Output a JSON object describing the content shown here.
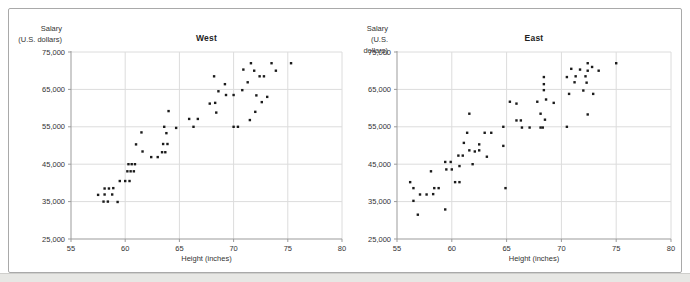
{
  "figure": {
    "background": "#ffffff",
    "frame_border_color": "#a9a9a9",
    "outside_strip_color": "#e7e7e4"
  },
  "colors": {
    "dot": "#1b1b1b",
    "grid": "#dcdcdc",
    "axis": "#9b9b9b",
    "tick_text": "#333333"
  },
  "chart_data": [
    {
      "type": "scatter",
      "title": "West",
      "xlabel": "Height (inches)",
      "ylabel_lines": [
        "Salary",
        "(U.S. dollars)"
      ],
      "xlim": [
        55,
        80
      ],
      "ylim": [
        25000,
        75000
      ],
      "grid": true,
      "legend": "none",
      "xticks": [
        55,
        60,
        65,
        70,
        75,
        80
      ],
      "xtick_labels": [
        "55",
        "60",
        "65",
        "70",
        "75",
        "80"
      ],
      "yticks": [
        25000,
        35000,
        45000,
        55000,
        65000,
        75000
      ],
      "ytick_labels": [
        "25,000",
        "35,000",
        "45,000",
        "55,000",
        "65,000",
        "75,000"
      ],
      "points": [
        [
          57.5,
          36800
        ],
        [
          58.1,
          36900
        ],
        [
          58.8,
          36900
        ],
        [
          58.1,
          38500
        ],
        [
          58.5,
          38500
        ],
        [
          58.9,
          38600
        ],
        [
          58.0,
          35000
        ],
        [
          58.4,
          35000
        ],
        [
          59.3,
          34900
        ],
        [
          59.5,
          40500
        ],
        [
          60.0,
          40500
        ],
        [
          60.4,
          40500
        ],
        [
          60.2,
          43100
        ],
        [
          60.5,
          43100
        ],
        [
          60.8,
          43100
        ],
        [
          60.3,
          45000
        ],
        [
          60.6,
          45000
        ],
        [
          60.9,
          45000
        ],
        [
          61.0,
          50300
        ],
        [
          61.6,
          48400
        ],
        [
          61.5,
          53500
        ],
        [
          62.4,
          46900
        ],
        [
          63.0,
          46900
        ],
        [
          63.4,
          48200
        ],
        [
          63.7,
          48200
        ],
        [
          63.5,
          50400
        ],
        [
          63.9,
          50400
        ],
        [
          63.8,
          53300
        ],
        [
          64.0,
          59200
        ],
        [
          64.7,
          54700
        ],
        [
          63.6,
          55000
        ],
        [
          66.3,
          55000
        ],
        [
          65.9,
          57100
        ],
        [
          66.7,
          57100
        ],
        [
          68.4,
          58800
        ],
        [
          67.8,
          61200
        ],
        [
          68.3,
          61400
        ],
        [
          68.6,
          64500
        ],
        [
          68.2,
          68500
        ],
        [
          69.2,
          66400
        ],
        [
          69.3,
          63500
        ],
        [
          70.0,
          63500
        ],
        [
          70.8,
          64800
        ],
        [
          71.3,
          66900
        ],
        [
          70.9,
          70300
        ],
        [
          71.6,
          72000
        ],
        [
          71.9,
          70000
        ],
        [
          72.4,
          68500
        ],
        [
          72.8,
          68500
        ],
        [
          73.5,
          72000
        ],
        [
          73.9,
          70000
        ],
        [
          75.3,
          72000
        ],
        [
          70.0,
          55000
        ],
        [
          70.4,
          55000
        ],
        [
          71.5,
          56800
        ],
        [
          72.0,
          59000
        ],
        [
          72.6,
          61600
        ],
        [
          73.1,
          63000
        ],
        [
          72.1,
          63400
        ]
      ]
    },
    {
      "type": "scatter",
      "title": "East",
      "xlabel": "Height (inches)",
      "ylabel_lines": [
        "Salary",
        "(U.S. dollars)"
      ],
      "xlim": [
        55,
        80
      ],
      "ylim": [
        25000,
        75000
      ],
      "grid": true,
      "legend": "none",
      "xticks": [
        55,
        60,
        65,
        70,
        75,
        80
      ],
      "xtick_labels": [
        "55",
        "60",
        "65",
        "70",
        "75",
        "80"
      ],
      "yticks": [
        25000,
        35000,
        45000,
        55000,
        65000,
        75000
      ],
      "ytick_labels": [
        "25,000",
        "35,000",
        "45,000",
        "55,000",
        "65,000",
        "75,000"
      ],
      "points": [
        [
          56.2,
          40200
        ],
        [
          56.5,
          38600
        ],
        [
          56.5,
          35200
        ],
        [
          56.9,
          31500
        ],
        [
          57.1,
          36900
        ],
        [
          57.7,
          36900
        ],
        [
          58.3,
          37000
        ],
        [
          58.1,
          43100
        ],
        [
          58.4,
          38600
        ],
        [
          58.8,
          38600
        ],
        [
          59.4,
          32900
        ],
        [
          59.4,
          45600
        ],
        [
          59.9,
          45600
        ],
        [
          59.5,
          43600
        ],
        [
          60.0,
          43600
        ],
        [
          60.3,
          40200
        ],
        [
          60.7,
          40200
        ],
        [
          60.7,
          44500
        ],
        [
          60.6,
          47300
        ],
        [
          61.0,
          47300
        ],
        [
          61.6,
          48700
        ],
        [
          62.1,
          48400
        ],
        [
          62.5,
          48700
        ],
        [
          61.1,
          50700
        ],
        [
          62.5,
          50300
        ],
        [
          61.4,
          53400
        ],
        [
          63.0,
          53400
        ],
        [
          63.6,
          53400
        ],
        [
          61.6,
          58500
        ],
        [
          61.9,
          45000
        ],
        [
          63.2,
          47000
        ],
        [
          64.7,
          49900
        ],
        [
          64.7,
          55000
        ],
        [
          64.9,
          38600
        ],
        [
          65.3,
          61700
        ],
        [
          65.9,
          61200
        ],
        [
          65.9,
          56700
        ],
        [
          66.3,
          56700
        ],
        [
          66.4,
          54800
        ],
        [
          67.1,
          54800
        ],
        [
          67.8,
          61700
        ],
        [
          68.1,
          58500
        ],
        [
          68.5,
          56900
        ],
        [
          68.1,
          54800
        ],
        [
          68.3,
          54800
        ],
        [
          68.4,
          68300
        ],
        [
          68.4,
          66400
        ],
        [
          68.4,
          64800
        ],
        [
          68.6,
          62300
        ],
        [
          69.3,
          61400
        ],
        [
          70.5,
          68300
        ],
        [
          70.9,
          70500
        ],
        [
          70.7,
          63800
        ],
        [
          70.5,
          55000
        ],
        [
          71.3,
          68500
        ],
        [
          71.7,
          70300
        ],
        [
          71.2,
          66900
        ],
        [
          72.4,
          72000
        ],
        [
          72.4,
          70000
        ],
        [
          72.8,
          71000
        ],
        [
          72.2,
          68500
        ],
        [
          72.3,
          66800
        ],
        [
          72.0,
          64700
        ],
        [
          72.9,
          63800
        ],
        [
          72.4,
          58300
        ],
        [
          73.4,
          70000
        ],
        [
          75.0,
          72000
        ]
      ]
    }
  ]
}
